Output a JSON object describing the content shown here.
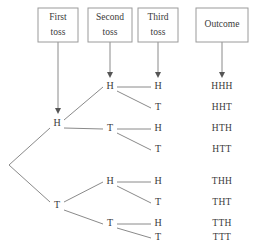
{
  "diagram": {
    "background_color": "#ffffff",
    "line_color": "#8a8a8a",
    "text_color": "#3a3a3a",
    "box_border_color": "#9a9a9a"
  },
  "headers": [
    {
      "line1": "First",
      "line2": "toss",
      "cx": 58,
      "cy": 25,
      "w": 40,
      "h": 34,
      "two_line": true
    },
    {
      "line1": "Second",
      "line2": "toss",
      "cx": 110,
      "cy": 25,
      "w": 44,
      "h": 34,
      "two_line": true
    },
    {
      "line1": "Third",
      "line2": "toss",
      "cx": 158,
      "cy": 25,
      "w": 40,
      "h": 34,
      "two_line": true
    },
    {
      "line1": "Outcome",
      "line2": "",
      "cx": 222,
      "cy": 25,
      "w": 52,
      "h": 34,
      "two_line": false
    }
  ],
  "pointers": [
    {
      "name": "pointer-first-toss",
      "x": 58,
      "y1": 42,
      "y2": 114
    },
    {
      "name": "pointer-second-toss",
      "x": 110,
      "y1": 42,
      "y2": 78
    },
    {
      "name": "pointer-third-toss",
      "x": 158,
      "y1": 42,
      "y2": 78
    },
    {
      "name": "pointer-outcome",
      "x": 222,
      "y1": 42,
      "y2": 78
    }
  ],
  "root": {
    "x": 9,
    "y": 165
  },
  "level1": [
    {
      "label": "H",
      "x": 57,
      "y": 124
    },
    {
      "label": "T",
      "x": 57,
      "y": 206
    }
  ],
  "level2": [
    {
      "label": "H",
      "x": 110,
      "y": 87,
      "parent": 0
    },
    {
      "label": "T",
      "x": 110,
      "y": 129,
      "parent": 0
    },
    {
      "label": "H",
      "x": 110,
      "y": 182,
      "parent": 1
    },
    {
      "label": "T",
      "x": 110,
      "y": 224,
      "parent": 1
    }
  ],
  "level3": [
    {
      "label": "H",
      "x": 158,
      "y": 87,
      "parent": 0
    },
    {
      "label": "T",
      "x": 158,
      "y": 108,
      "parent": 0
    },
    {
      "label": "H",
      "x": 158,
      "y": 129,
      "parent": 1
    },
    {
      "label": "T",
      "x": 158,
      "y": 150,
      "parent": 1
    },
    {
      "label": "H",
      "x": 158,
      "y": 182,
      "parent": 2
    },
    {
      "label": "T",
      "x": 158,
      "y": 203,
      "parent": 2
    },
    {
      "label": "H",
      "x": 158,
      "y": 224,
      "parent": 3
    },
    {
      "label": "T",
      "x": 158,
      "y": 238,
      "parent": 3
    }
  ],
  "outcomes": [
    {
      "label": "HHH",
      "x": 222,
      "y": 87
    },
    {
      "label": "HHT",
      "x": 222,
      "y": 108
    },
    {
      "label": "HTH",
      "x": 222,
      "y": 129
    },
    {
      "label": "HTT",
      "x": 222,
      "y": 150
    },
    {
      "label": "THH",
      "x": 222,
      "y": 182
    },
    {
      "label": "THT",
      "x": 222,
      "y": 203
    },
    {
      "label": "TTH",
      "x": 222,
      "y": 224
    },
    {
      "label": "TTT",
      "x": 222,
      "y": 238
    }
  ]
}
